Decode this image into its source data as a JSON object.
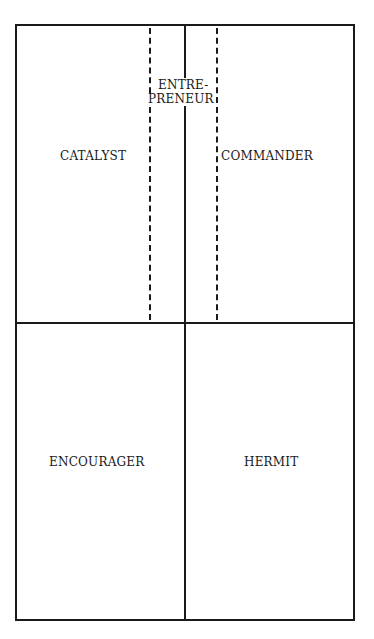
{
  "diagram": {
    "quadrants": [
      {
        "id": "top-left",
        "label": "CATALYST"
      },
      {
        "id": "top-right",
        "label": "COMMANDER"
      },
      {
        "id": "bottom-left",
        "label": "ENCOURAGER"
      },
      {
        "id": "bottom-right",
        "label": "HERMIT"
      }
    ],
    "overlap_region": {
      "label_line1": "ENTRE-",
      "label_line2": "PRENEUR",
      "style": "dashed"
    },
    "colors": {
      "line": "#1a1a1a",
      "background": "#ffffff"
    }
  }
}
